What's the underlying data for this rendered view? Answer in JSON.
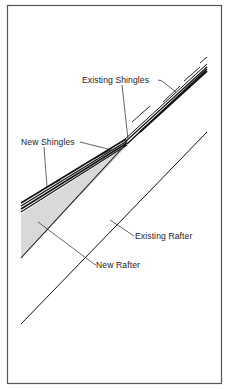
{
  "figure": {
    "type": "roof-section-diagram",
    "labels": {
      "existing_shingles": "Existing Shingles",
      "new_shingles": "New Shingles",
      "existing_rafter": "Existing Rafter",
      "new_rafter": "New Rafter"
    },
    "colors": {
      "frame": "#555555",
      "lines": "#111111",
      "new_rafter_fill": "#d8d8d8",
      "background": "#ffffff"
    }
  }
}
